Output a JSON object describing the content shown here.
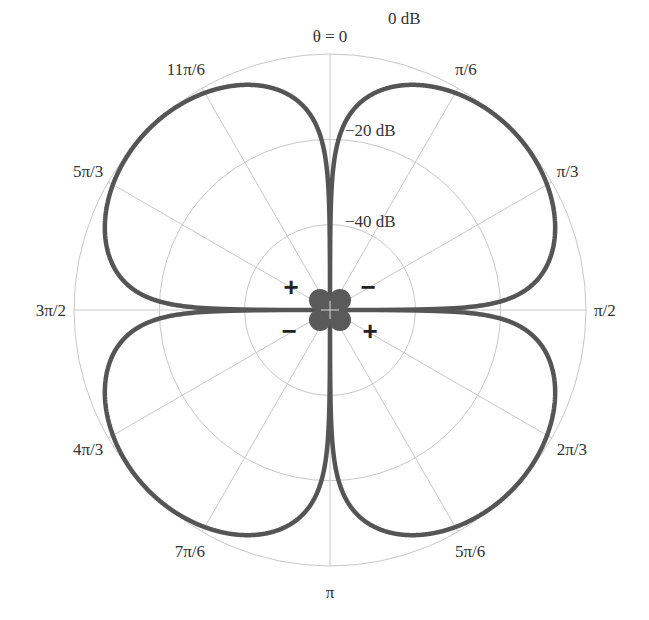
{
  "chart_data": {
    "type": "polar-line",
    "title": "",
    "angle_zero_label": "θ = 0",
    "angle_direction": "clockwise",
    "angle_zero_position": "top",
    "angular_tick_labels": [
      {
        "angle_deg": 30,
        "label": "π/6"
      },
      {
        "angle_deg": 60,
        "label": "π/3"
      },
      {
        "angle_deg": 90,
        "label": "π/2"
      },
      {
        "angle_deg": 120,
        "label": "2π/3"
      },
      {
        "angle_deg": 150,
        "label": "5π/6"
      },
      {
        "angle_deg": 180,
        "label": "π"
      },
      {
        "angle_deg": 210,
        "label": "7π/6"
      },
      {
        "angle_deg": 240,
        "label": "4π/3"
      },
      {
        "angle_deg": 270,
        "label": "3π/2"
      },
      {
        "angle_deg": 300,
        "label": "5π/3"
      },
      {
        "angle_deg": 330,
        "label": "11π/6"
      }
    ],
    "radial_unit": "dB",
    "radial_range_db": [
      -60,
      0
    ],
    "radial_tick_labels": [
      {
        "db": 0,
        "label": "0 dB"
      },
      {
        "db": -20,
        "label": "−20 dB"
      },
      {
        "db": -40,
        "label": "−40 dB"
      }
    ],
    "series": [
      {
        "name": "quadrupole radiation pattern",
        "formula": "20*log10(|sin(2θ)|)",
        "color": "#555555",
        "samples": [
          {
            "angle_deg": 0,
            "db": -60
          },
          {
            "angle_deg": 5,
            "db": -15.3
          },
          {
            "angle_deg": 15,
            "db": -6.0
          },
          {
            "angle_deg": 30,
            "db": -1.25
          },
          {
            "angle_deg": 45,
            "db": 0
          },
          {
            "angle_deg": 60,
            "db": -1.25
          },
          {
            "angle_deg": 75,
            "db": -6.0
          },
          {
            "angle_deg": 85,
            "db": -15.3
          },
          {
            "angle_deg": 90,
            "db": -60
          }
        ],
        "symmetry": "four identical lobes at 45°, 135°, 225°, 315°"
      }
    ],
    "annotations": [
      {
        "text": "+",
        "position": "upper-left of origin"
      },
      {
        "text": "−",
        "position": "upper-right of origin"
      },
      {
        "text": "−",
        "position": "lower-left of origin"
      },
      {
        "text": "+",
        "position": "lower-right of origin"
      }
    ],
    "source_glyph": "four small filled circles (quadrupole) at origin",
    "grid": true,
    "colors": {
      "curve": "#555555",
      "grid": "#c8c8c8",
      "text": "#333333"
    }
  }
}
